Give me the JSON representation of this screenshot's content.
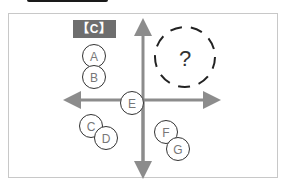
{
  "diagram": {
    "label": "【C】",
    "axis_color": "#8c8c8c",
    "node_stroke": "#333333",
    "nodes": [
      {
        "id": "A",
        "label": "A",
        "cx": 94,
        "cy": 56
      },
      {
        "id": "B",
        "label": "B",
        "cx": 94,
        "cy": 77
      },
      {
        "id": "C",
        "label": "C",
        "cx": 91,
        "cy": 126
      },
      {
        "id": "D",
        "label": "D",
        "cx": 106,
        "cy": 138
      },
      {
        "id": "E",
        "label": "E",
        "cx": 132,
        "cy": 103
      },
      {
        "id": "F",
        "label": "F",
        "cx": 166,
        "cy": 132
      },
      {
        "id": "G",
        "label": "G",
        "cx": 178,
        "cy": 149
      }
    ],
    "unknown": {
      "label": "?",
      "cx": 185,
      "cy": 57
    }
  }
}
